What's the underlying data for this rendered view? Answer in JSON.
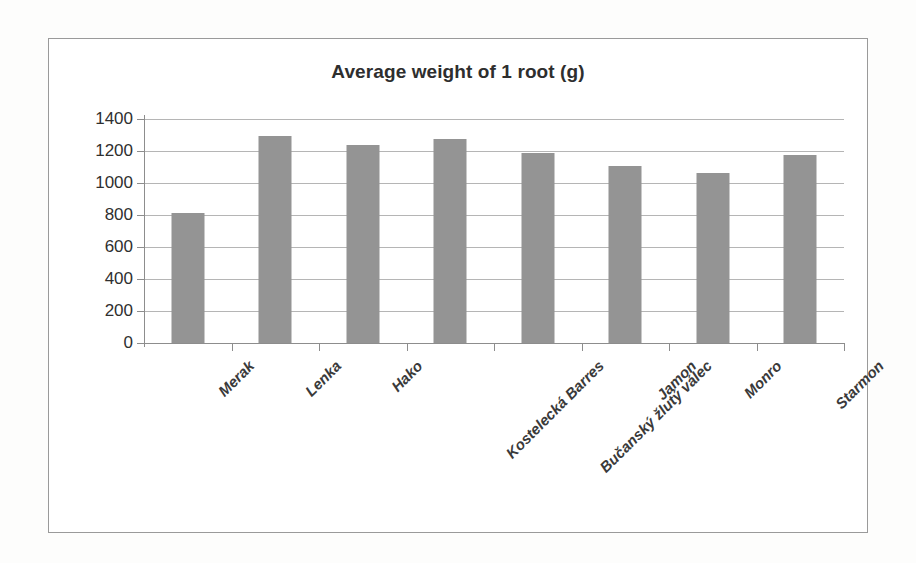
{
  "chart_data": {
    "type": "bar",
    "title": "Average weight of 1 root (g)",
    "xlabel": "",
    "ylabel": "",
    "categories": [
      "Merak",
      "Lenka",
      "Hako",
      "Kostelecká Barres",
      "Bučanský žlutý válec",
      "Jamon",
      "Monro",
      "Starmon"
    ],
    "values": [
      810,
      1295,
      1240,
      1275,
      1190,
      1105,
      1065,
      1175
    ],
    "ylim": [
      0,
      1400
    ],
    "yticks": [
      0,
      200,
      400,
      600,
      800,
      1000,
      1200,
      1400
    ],
    "ytick_labels": [
      "0",
      "200",
      "400",
      "600",
      "800",
      "1000",
      "1200",
      "1400"
    ],
    "grid": true,
    "legend": false,
    "legend_position": "none",
    "bar_color": "#949494",
    "gridline_color": "#b5b5b5",
    "axis_color": "#8d8d8d",
    "frame_color": "#9a9a9a",
    "background_color": "#ffffff"
  }
}
